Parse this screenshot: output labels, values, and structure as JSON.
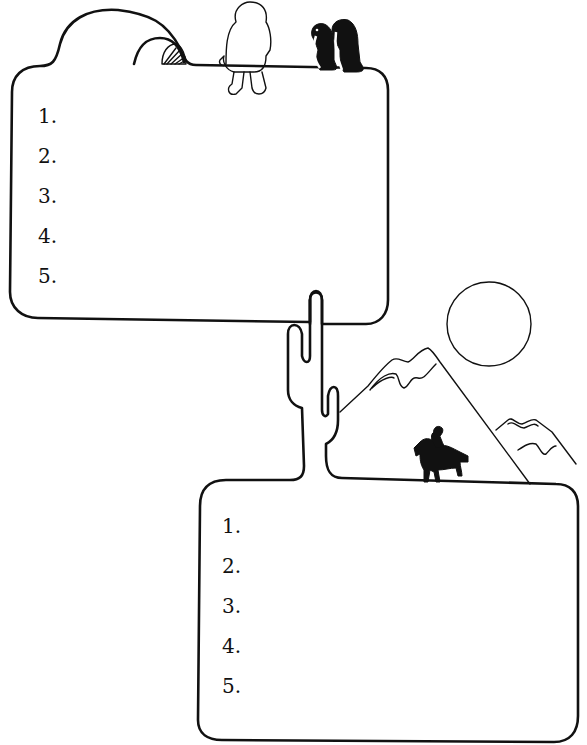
{
  "worksheet": {
    "top_panel": {
      "theme": "arctic",
      "illustrations": [
        "igloo-icon",
        "eskimo-child-icon",
        "penguin-icon",
        "penguin-icon"
      ],
      "items": [
        {
          "number": "1."
        },
        {
          "number": "2."
        },
        {
          "number": "3."
        },
        {
          "number": "4."
        },
        {
          "number": "5."
        }
      ]
    },
    "bottom_panel": {
      "theme": "desert",
      "illustrations": [
        "cactus-icon",
        "sun-icon",
        "mountain-icon",
        "mountain-icon",
        "horse-rider-icon"
      ],
      "items": [
        {
          "number": "1."
        },
        {
          "number": "2."
        },
        {
          "number": "3."
        },
        {
          "number": "4."
        },
        {
          "number": "5."
        }
      ]
    },
    "colors": {
      "ink": "#111111",
      "paper": "#ffffff"
    }
  }
}
